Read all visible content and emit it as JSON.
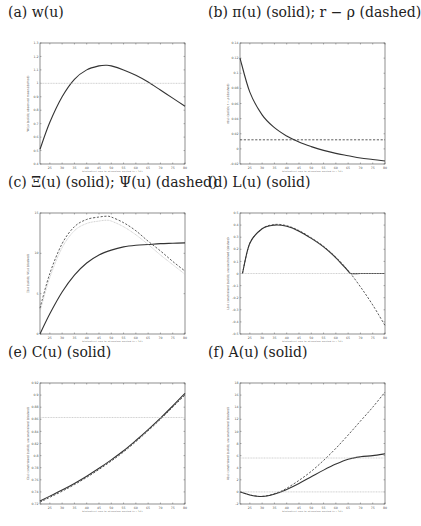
{
  "figure": {
    "panels": [
      {
        "id": "a",
        "title": "(a) w(u)"
      },
      {
        "id": "b",
        "title": "(b) π(u) (solid); r − ρ (dashed)"
      },
      {
        "id": "c",
        "title": "(c) Ξ(u) (solid); Ψ(u) (dashed)"
      },
      {
        "id": "d",
        "title": "(d) L(u) (solid)"
      },
      {
        "id": "e",
        "title": "(e) C(u) (solid)"
      },
      {
        "id": "f",
        "title": "(f) A(u) (solid)"
      }
    ],
    "xlabel": "biological age in planning period (u+21)",
    "xticks": [
      "25",
      "30",
      "35",
      "40",
      "45",
      "50",
      "55",
      "60",
      "65",
      "70",
      "75",
      "80"
    ]
  },
  "chart_data": [
    {
      "id": "a",
      "type": "line",
      "title": "(a) w(u)",
      "xlabel": "biological age in planning period (u+21)",
      "ylabel": "W(u) (solid); observed mean (dotted)",
      "xlim": [
        21,
        80
      ],
      "ylim": [
        0.4,
        1.3
      ],
      "yticks": [
        "0.4",
        "0.5",
        "0.6",
        "0.7",
        "0.8",
        "0.9",
        "1",
        "1.1",
        "1.2",
        "1.3"
      ],
      "series": [
        {
          "name": "w(u)",
          "style": "solid",
          "x": [
            21,
            25,
            30,
            35,
            40,
            45,
            48,
            50,
            55,
            60,
            65,
            70,
            75,
            80
          ],
          "y": [
            0.51,
            0.71,
            0.9,
            1.03,
            1.1,
            1.13,
            1.135,
            1.13,
            1.1,
            1.06,
            1.01,
            0.95,
            0.89,
            0.83
          ]
        },
        {
          "name": "reference",
          "style": "dotted",
          "x": [
            21,
            80
          ],
          "y": [
            1.0,
            1.0
          ]
        }
      ]
    },
    {
      "id": "b",
      "type": "line",
      "title": "(b) π(u) (solid); r − ρ (dashed)",
      "xlabel": "biological age in planning period (u+21)",
      "ylabel": "π(u) (solid); r − ρ (dashed)",
      "xlim": [
        21,
        80
      ],
      "ylim": [
        -0.02,
        0.14
      ],
      "yticks": [
        "-0.02",
        "0",
        "0.02",
        "0.04",
        "0.06",
        "0.08",
        "0.1",
        "0.12",
        "0.14"
      ],
      "series": [
        {
          "name": "π(u)",
          "style": "solid",
          "x": [
            21,
            25,
            30,
            35,
            40,
            45,
            50,
            55,
            60,
            65,
            70,
            75,
            80
          ],
          "y": [
            0.12,
            0.075,
            0.045,
            0.028,
            0.017,
            0.009,
            0.003,
            -0.002,
            -0.006,
            -0.009,
            -0.012,
            -0.014,
            -0.016
          ]
        },
        {
          "name": "r − ρ",
          "style": "dashed",
          "x": [
            21,
            80
          ],
          "y": [
            0.012,
            0.012
          ]
        }
      ]
    },
    {
      "id": "c",
      "type": "line",
      "title": "(c) Ξ(u) (solid); Ψ(u) (dashed)",
      "xlabel": "biological age in planning period (u+21)",
      "ylabel": "Ξ(u) (solid); Ψ(u) (dashed)",
      "xlim": [
        21,
        80
      ],
      "ylim": [
        0,
        15
      ],
      "yticks": [
        "0",
        "5",
        "10",
        "15"
      ],
      "series": [
        {
          "name": "Ξ(u)",
          "style": "solid",
          "x": [
            21,
            25,
            30,
            35,
            40,
            45,
            50,
            55,
            60,
            65,
            70,
            75,
            80
          ],
          "y": [
            0,
            2.5,
            5.2,
            7.3,
            8.8,
            9.8,
            10.4,
            10.8,
            11.0,
            11.1,
            11.2,
            11.25,
            11.3
          ]
        },
        {
          "name": "Ψ(u)",
          "style": "dashed",
          "x": [
            21,
            25,
            30,
            35,
            40,
            45,
            48,
            50,
            55,
            60,
            65,
            70,
            75,
            80
          ],
          "y": [
            3.2,
            7.5,
            11.2,
            13.3,
            14.2,
            14.5,
            14.6,
            14.5,
            13.8,
            12.8,
            11.5,
            10.3,
            9.0,
            7.8
          ]
        },
        {
          "name": "Ψ(u) alt",
          "style": "dotted",
          "x": [
            21,
            25,
            30,
            35,
            40,
            45,
            48,
            50,
            55,
            60,
            65,
            70,
            75,
            80
          ],
          "y": [
            2.8,
            7.0,
            10.7,
            12.8,
            13.7,
            14.0,
            14.1,
            14.0,
            13.3,
            12.3,
            11.1,
            9.8,
            8.6,
            7.4
          ]
        }
      ]
    },
    {
      "id": "d",
      "type": "line",
      "title": "(d) L(u) (solid)",
      "xlabel": "biological age in planning period (u+21)",
      "ylabel": "L(u) constrained (solid); unconstrained (dashed)",
      "xlim": [
        21,
        80
      ],
      "ylim": [
        -0.5,
        0.5
      ],
      "yticks": [
        "-0.5",
        "-0.4",
        "-0.3",
        "-0.2",
        "-0.1",
        "0",
        "0.1",
        "0.2",
        "0.3",
        "0.4",
        "0.5"
      ],
      "series": [
        {
          "name": "L(u) constrained",
          "style": "solid",
          "x": [
            22,
            25,
            30,
            35,
            40,
            45,
            50,
            55,
            60,
            65,
            66,
            70,
            75,
            80
          ],
          "y": [
            0,
            0.25,
            0.37,
            0.4,
            0.39,
            0.35,
            0.29,
            0.22,
            0.13,
            0.02,
            0,
            0,
            0,
            0
          ]
        },
        {
          "name": "L(u) unconstrained",
          "style": "dashed",
          "x": [
            22,
            25,
            30,
            35,
            40,
            45,
            50,
            55,
            60,
            65,
            70,
            75,
            80
          ],
          "y": [
            0,
            0.25,
            0.37,
            0.405,
            0.395,
            0.355,
            0.295,
            0.225,
            0.135,
            0.025,
            -0.11,
            -0.26,
            -0.43
          ]
        },
        {
          "name": "zero",
          "style": "dotted",
          "x": [
            21,
            80
          ],
          "y": [
            0,
            0
          ]
        }
      ]
    },
    {
      "id": "e",
      "type": "line",
      "title": "(e) C(u) (solid)",
      "xlabel": "biological age in planning period (u+21)",
      "ylabel": "C(u) constrained (solid); unconstrained (dashed)",
      "xlim": [
        21,
        80
      ],
      "ylim": [
        0.72,
        0.92
      ],
      "yticks": [
        "0.72",
        "0.74",
        "0.76",
        "0.78",
        "0.8",
        "0.82",
        "0.84",
        "0.86",
        "0.88",
        "0.9",
        "0.92"
      ],
      "series": [
        {
          "name": "C(u) constrained",
          "style": "solid",
          "x": [
            21,
            25,
            30,
            35,
            40,
            45,
            50,
            55,
            60,
            65,
            70,
            75,
            80
          ],
          "y": [
            0.725,
            0.733,
            0.743,
            0.754,
            0.766,
            0.779,
            0.793,
            0.808,
            0.825,
            0.843,
            0.862,
            0.882,
            0.903
          ]
        },
        {
          "name": "C(u) unconstrained",
          "style": "dashed",
          "x": [
            21,
            25,
            30,
            35,
            40,
            45,
            50,
            55,
            60,
            65,
            70,
            75,
            80
          ],
          "y": [
            0.723,
            0.731,
            0.741,
            0.752,
            0.764,
            0.777,
            0.791,
            0.806,
            0.823,
            0.841,
            0.86,
            0.88,
            0.9
          ]
        },
        {
          "name": "reference",
          "style": "dotted",
          "x": [
            21,
            80
          ],
          "y": [
            0.863,
            0.863
          ]
        }
      ]
    },
    {
      "id": "f",
      "type": "line",
      "title": "(f) A(u) (solid)",
      "xlabel": "biological age in planning period (u+21)",
      "ylabel": "A(u) constrained (solid); unconstrained (dashed)",
      "xlim": [
        21,
        80
      ],
      "ylim": [
        -2,
        18
      ],
      "yticks": [
        "-2",
        "0",
        "2",
        "4",
        "6",
        "8",
        "10",
        "12",
        "14",
        "16",
        "18"
      ],
      "series": [
        {
          "name": "A(u) constrained",
          "style": "solid",
          "x": [
            21,
            25,
            29,
            33,
            37,
            40,
            45,
            50,
            55,
            60,
            65,
            70,
            75,
            80
          ],
          "y": [
            0,
            -0.5,
            -0.75,
            -0.6,
            -0.1,
            0.4,
            1.4,
            2.5,
            3.6,
            4.6,
            5.4,
            5.8,
            6.0,
            6.3
          ]
        },
        {
          "name": "A(u) unconstrained",
          "style": "dashed",
          "x": [
            21,
            25,
            29,
            33,
            37,
            40,
            45,
            50,
            55,
            60,
            65,
            70,
            75,
            80
          ],
          "y": [
            0,
            -0.5,
            -0.75,
            -0.55,
            0,
            0.6,
            1.9,
            3.4,
            5.2,
            7.2,
            9.4,
            11.7,
            14.0,
            16.5
          ]
        },
        {
          "name": "upper reference",
          "style": "dotted",
          "x": [
            21,
            80
          ],
          "y": [
            5.6,
            5.6
          ]
        },
        {
          "name": "zero",
          "style": "dotted",
          "x": [
            21,
            80
          ],
          "y": [
            0,
            0
          ]
        }
      ]
    }
  ]
}
